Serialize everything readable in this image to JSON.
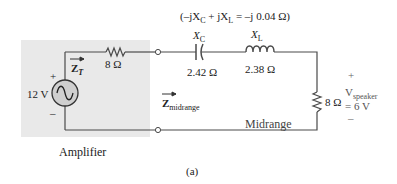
{
  "figure": {
    "caption": "(a)",
    "colors": {
      "wire": "#4a4a4a",
      "amplifier_box": "#e9e9e9",
      "source_fill": "#cfcfcf",
      "text": "#222222"
    }
  },
  "amplifier": {
    "label": "Amplifier",
    "source": {
      "voltage_label": "12 V",
      "plus": "+",
      "minus": "–",
      "symbol": "ac-source"
    },
    "internal_resistor": {
      "value_label": "8 Ω"
    },
    "impedance_arrow": {
      "symbol": "Z",
      "subscript": "T"
    }
  },
  "midrange_network": {
    "net_reactance": {
      "open": "(–j",
      "xc": "X",
      "xc_sub": "C",
      "plus_j": " + j",
      "xl": "X",
      "xl_sub": "L",
      "result": " = –j 0.04 Ω)"
    },
    "capacitor": {
      "name_symbol": "X",
      "name_sub": "C",
      "value_label": "2.42 Ω"
    },
    "inductor": {
      "name_symbol": "X",
      "name_sub": "L",
      "value_label": "2.38 Ω"
    },
    "impedance_arrow": {
      "symbol": "Z",
      "subscript": "midrange"
    },
    "branch_label": "Midrange"
  },
  "speaker": {
    "resistor_value": "8 Ω",
    "plus": "+",
    "minus": "–",
    "voltage_symbol": "V",
    "voltage_sub": "speaker",
    "voltage_value": "= 6 V"
  }
}
